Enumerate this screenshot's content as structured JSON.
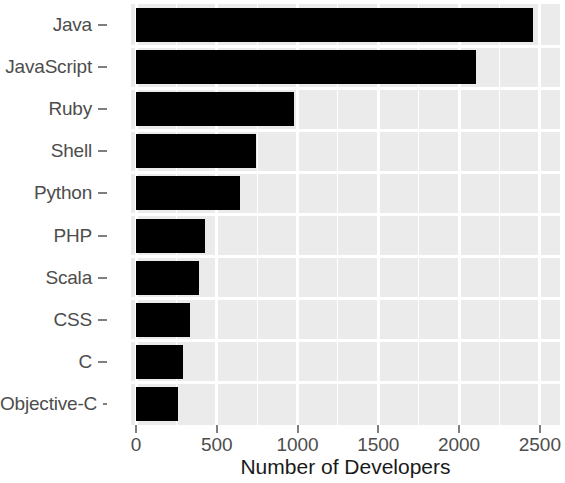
{
  "chart_data": {
    "type": "bar",
    "orientation": "horizontal",
    "title": "",
    "xlabel": "Number of Developers",
    "ylabel": "",
    "categories": [
      "Java",
      "JavaScript",
      "Ruby",
      "Shell",
      "Python",
      "PHP",
      "Scala",
      "CSS",
      "C",
      "Objective-C"
    ],
    "values": [
      2456,
      2107,
      979,
      742,
      642,
      430,
      393,
      337,
      293,
      262
    ],
    "xlim": [
      0,
      2600
    ],
    "ylim": null,
    "x_ticks": [
      0,
      500,
      1000,
      1500,
      2000,
      2500
    ],
    "x_tick_labels": [
      "0",
      "500",
      "1000",
      "1500",
      "2000",
      "2500"
    ],
    "x_minor_ticks": [
      250,
      750,
      1250,
      1750,
      2250
    ],
    "grid": true,
    "legend": null,
    "bar_color": "#000000",
    "panel_color": "#ebebeb",
    "grid_color": "#ffffff",
    "axis_text_color": "#4d4d4d",
    "axis_title_color": "#1a1a1a"
  },
  "axis": {
    "x_title": "Number of Developers"
  }
}
